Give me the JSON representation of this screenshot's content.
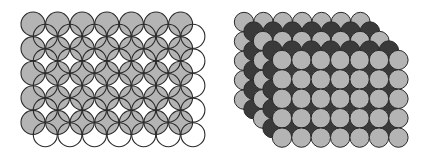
{
  "diagram": {
    "colors": {
      "gray_fill": "#b4b4b4",
      "dark_fill": "#3a3a3a",
      "white_fill": "#ffffff",
      "stroke": "#2a2a2a"
    },
    "left_figure": {
      "name": "overlapping-layers-outline",
      "layers": [
        {
          "fill": "gray",
          "cols": 7,
          "rows": 5,
          "x0": 33,
          "y0": 24,
          "step": 24.6,
          "r": 12,
          "opacity": 1
        },
        {
          "fill": "none",
          "cols": 7,
          "rows": 5,
          "x0": 45.3,
          "y0": 36.3,
          "step": 24.6,
          "r": 12,
          "opacity": 1
        }
      ]
    },
    "right_figure": {
      "name": "stacked-layers-3d",
      "layers": [
        {
          "fill": "gray",
          "cols": 7,
          "rows": 5,
          "x0": 244,
          "y0": 22,
          "step": 19.4,
          "r": 9.7
        },
        {
          "fill": "dark",
          "cols": 7,
          "rows": 5,
          "x0": 253.5,
          "y0": 31.5,
          "step": 19.4,
          "r": 9.7
        },
        {
          "fill": "gray",
          "cols": 7,
          "rows": 5,
          "x0": 263,
          "y0": 41,
          "step": 19.4,
          "r": 9.7
        },
        {
          "fill": "dark",
          "cols": 7,
          "rows": 5,
          "x0": 272.5,
          "y0": 50.5,
          "step": 19.4,
          "r": 9.7
        },
        {
          "fill": "gray",
          "cols": 7,
          "rows": 5,
          "x0": 282,
          "y0": 60,
          "step": 19.4,
          "r": 9.7
        }
      ]
    }
  }
}
